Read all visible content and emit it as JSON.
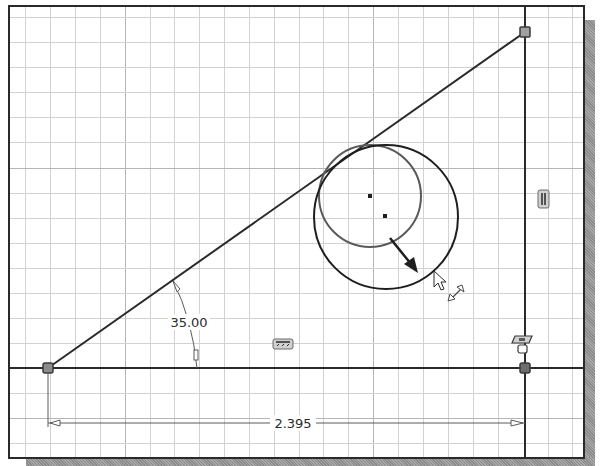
{
  "window": {
    "title": "Sketch canvas",
    "colors": {
      "background": "#ffffff",
      "grid_minor": "#cfcfcf",
      "grid_major": "#b9b9b9",
      "geometry": "#2a2a2a",
      "inner_circle": "#5a5a5a",
      "point_fill": "#8c8c8c",
      "frame": "#2a2a2a",
      "shadow": "#9a9a9a"
    }
  },
  "sketch": {
    "dimensions": {
      "angle": {
        "label": "35.00",
        "units": "deg"
      },
      "horizontal": {
        "label": "2.395"
      }
    },
    "constraints": [
      {
        "type": "parallel",
        "icon": "parallel-constraint-icon",
        "location": "vertical line"
      },
      {
        "type": "horizontal",
        "icon": "horizontal-constraint-icon",
        "location": "base line"
      },
      {
        "type": "fix-coincident",
        "icon": "fix-constraint-icon",
        "location": "bottom-right corner"
      }
    ],
    "points": [
      {
        "name": "bottom-left-endpoint"
      },
      {
        "name": "top-right-endpoint"
      },
      {
        "name": "bottom-right-endpoint"
      }
    ],
    "circles": [
      {
        "name": "original-circle",
        "state": "previous"
      },
      {
        "name": "dragged-circle",
        "state": "resizing"
      }
    ],
    "cursor": {
      "type": "arrow-pointer",
      "hint": "resize-diagonal"
    }
  }
}
